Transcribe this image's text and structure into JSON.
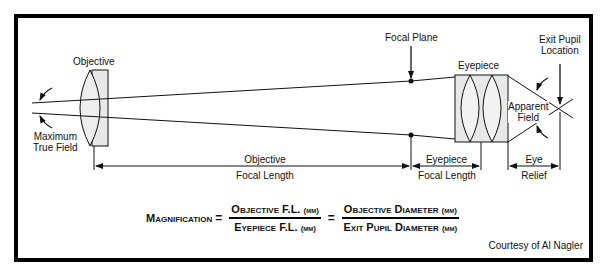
{
  "top_cutoff_text": "",
  "labels": {
    "objective": "Objective",
    "maximum_true_field": [
      "Maximum",
      "True Field"
    ],
    "focal_plane": "Focal Plane",
    "eyepiece": "Eyepiece",
    "exit_pupil_location": [
      "Exit Pupil",
      "Location"
    ],
    "apparent_field": [
      "Apparent",
      "Field"
    ]
  },
  "dimensions": {
    "objective_focal_length": [
      "Objective",
      "Focal Length"
    ],
    "eyepiece_focal_length": [
      "Eyepiece",
      "Focal Length"
    ],
    "eye_relief": [
      "Eye",
      "Relief"
    ]
  },
  "formula": {
    "lhs": "Magnification",
    "eq1": "=",
    "frac1_num": "Objective F.L.",
    "frac1_den": "Eyepiece F.L.",
    "eq2": "=",
    "frac2_num": "Objective Diameter",
    "frac2_den": "Exit Pupil Diameter",
    "unit": "(mm)"
  },
  "credit": "Courtesy of Al Nagler",
  "colors": {
    "frame": "#000000",
    "lens_fill": "#e8e8e8",
    "line": "#111111",
    "background": "#ffffff"
  }
}
